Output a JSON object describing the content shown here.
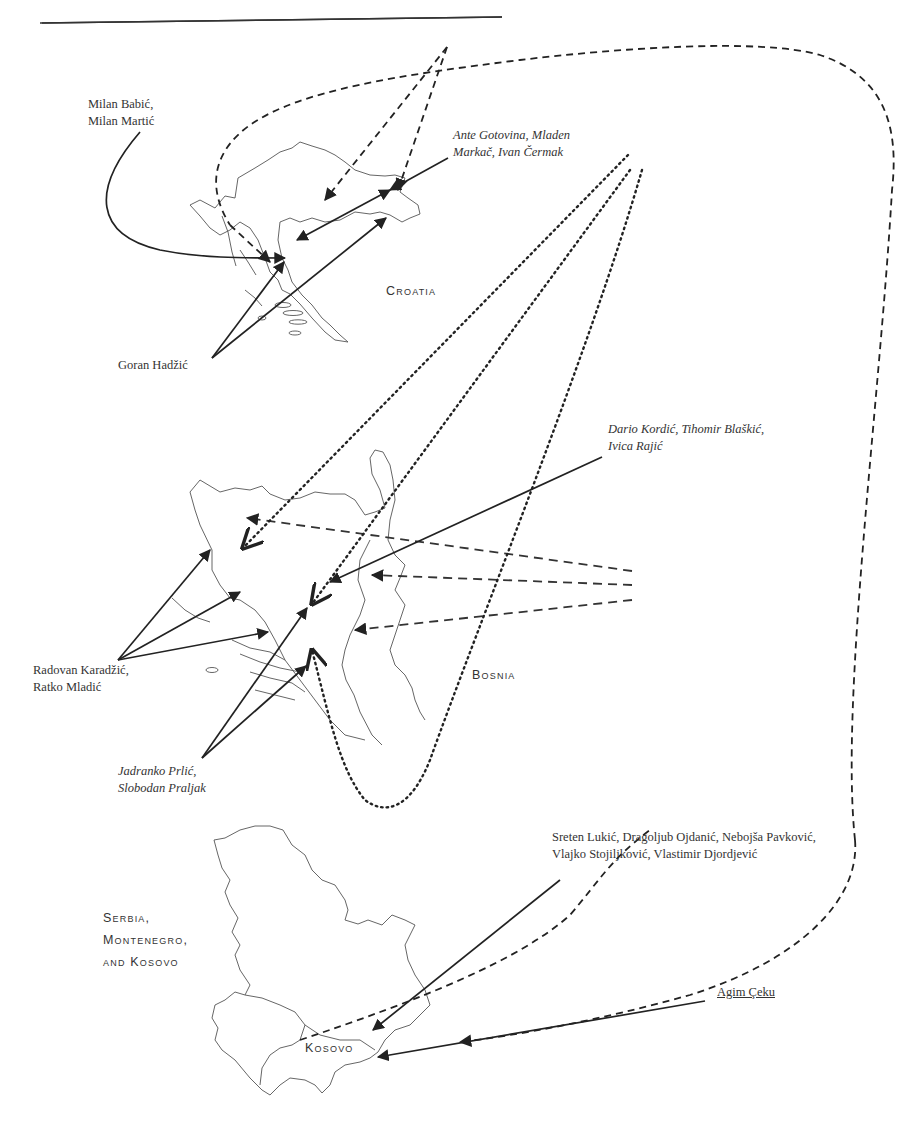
{
  "page": {
    "rule": "top-horizontal-rule"
  },
  "regions": {
    "croatia": "Croatia",
    "bosnia": "Bosnia",
    "serbia_line1": "Serbia,",
    "serbia_line2": "Montenegro,",
    "serbia_line3": "and Kosovo",
    "kosovo": "Kosovo"
  },
  "influences": {
    "croatia_line1": "Influence of Croatia",
    "croatia_line2": "(Franjo Tudjman)",
    "serbia_line1": "Influence of Serbia",
    "serbia_line2": "(Slobodan Milošević)"
  },
  "people": {
    "babic_martic_line1": "Milan Babić,",
    "babic_martic_line2": "Milan Martić",
    "gotovina_line1": "Ante Gotovina, Mladen",
    "gotovina_line2": "Markač, Ivan Čermak",
    "hadzic": "Goran Hadžić",
    "kordic_line1": "Dario Kordić, Tihomir Blaškić,",
    "kordic_line2": "Ivica Rajić",
    "karadzic_line1": "Radovan Karadžić,",
    "karadzic_line2": "Ratko Mladić",
    "prlic_line1": "Jadranko Prlić,",
    "prlic_line2": "Slobodan Praljak",
    "lukic_line1": "Sreten Lukić, Dragoljub Ojdanić, Nebojša Pavković,",
    "lukic_line2": "Vlajko Stojiljković, Vlastimir Djordjević",
    "ceku": "Agim Çeku"
  },
  "legend": {
    "solid": "individual-link",
    "dashed": "serbian-influence",
    "dotted": "croatian-influence"
  },
  "colors": {
    "ink": "#222222",
    "outline": "#555555"
  }
}
